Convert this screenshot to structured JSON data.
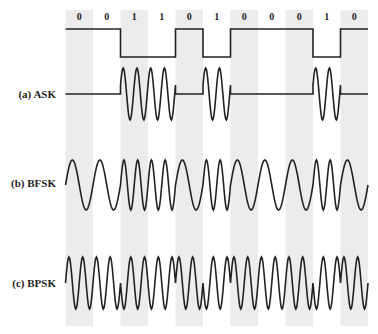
{
  "figure": {
    "width": 378,
    "height": 334,
    "bit_sequence": [
      0,
      0,
      1,
      1,
      0,
      1,
      0,
      0,
      0,
      1,
      0
    ],
    "bit_labels": [
      "0",
      "0",
      "1",
      "1",
      "0",
      "1",
      "0",
      "0",
      "0",
      "1",
      "0"
    ],
    "x_start": 65.5,
    "bit_width": 27.5,
    "stripe_top": 10,
    "stripe_bottom": 326,
    "stripe_color": "#ececec",
    "line_color": "#222222",
    "shaded_bit_indices": [
      0,
      2,
      4,
      6,
      8,
      10
    ]
  },
  "signals": {
    "digital": {
      "label": "",
      "high_y": 29,
      "low_y": 57
    },
    "ask": {
      "label": "(a) ASK",
      "center_y": 94,
      "amplitude": 26,
      "cycles_per_bit": 2
    },
    "bfsk": {
      "label": "(b) BFSK",
      "center_y": 185,
      "amplitude": 25,
      "cycles_per_bit_0": 1,
      "cycles_per_bit_1": 2
    },
    "bpsk": {
      "label": "(c) BPSK",
      "center_y": 283,
      "amplitude": 26,
      "cycles_per_bit": 2
    }
  }
}
